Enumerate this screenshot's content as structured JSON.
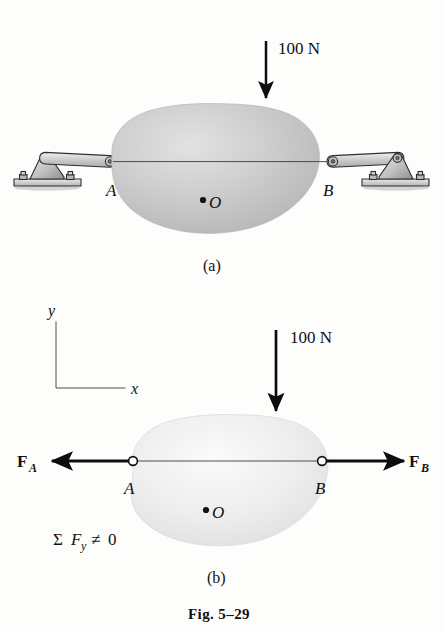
{
  "figure": {
    "caption": "Fig. 5–29",
    "background_color": "#fdfdfc",
    "ink_color": "#111111"
  },
  "panels": [
    {
      "id": "a",
      "label": "(a)",
      "description": "Body supported by two pin-connected links at A and B with 100 N downward load",
      "load": {
        "label": "100 N",
        "direction": "down",
        "magnitude": 100,
        "unit": "N"
      },
      "points": [
        {
          "name": "A",
          "label": "A",
          "x": 113,
          "y": 167
        },
        {
          "name": "B",
          "label": "B",
          "x": 330,
          "y": 167
        },
        {
          "name": "O",
          "label": "O",
          "x": 214,
          "y": 203
        }
      ],
      "supports": [
        {
          "side": "left",
          "type": "pin-bracket-on-base"
        },
        {
          "side": "right",
          "type": "pin-bracket-on-base"
        }
      ],
      "body": {
        "fill": "#c3c3c3",
        "shading": "radial-gray"
      }
    },
    {
      "id": "b",
      "label": "(b)",
      "description": "Free body diagram with reaction forces FA and FB collinear and horizontal",
      "load": {
        "label": "100 N",
        "direction": "down",
        "magnitude": 100,
        "unit": "N"
      },
      "axes": {
        "y_label": "y",
        "x_label": "x"
      },
      "forces": [
        {
          "name": "FA",
          "base": "F",
          "subscript": "A",
          "direction": "left"
        },
        {
          "name": "FB",
          "base": "F",
          "subscript": "B",
          "direction": "right"
        }
      ],
      "points": [
        {
          "name": "A",
          "label": "A",
          "x": 133,
          "y": 478
        },
        {
          "name": "B",
          "label": "B",
          "x": 322,
          "y": 478
        },
        {
          "name": "O",
          "label": "O",
          "x": 216,
          "y": 513
        }
      ],
      "equation": {
        "sigma": "Σ",
        "base": "F",
        "subscript": "y",
        "relation": "≠",
        "value": "0",
        "full_text": "Σ F y ≠ 0"
      },
      "body": {
        "fill": "#ededed",
        "shading": "light-gray"
      }
    }
  ]
}
